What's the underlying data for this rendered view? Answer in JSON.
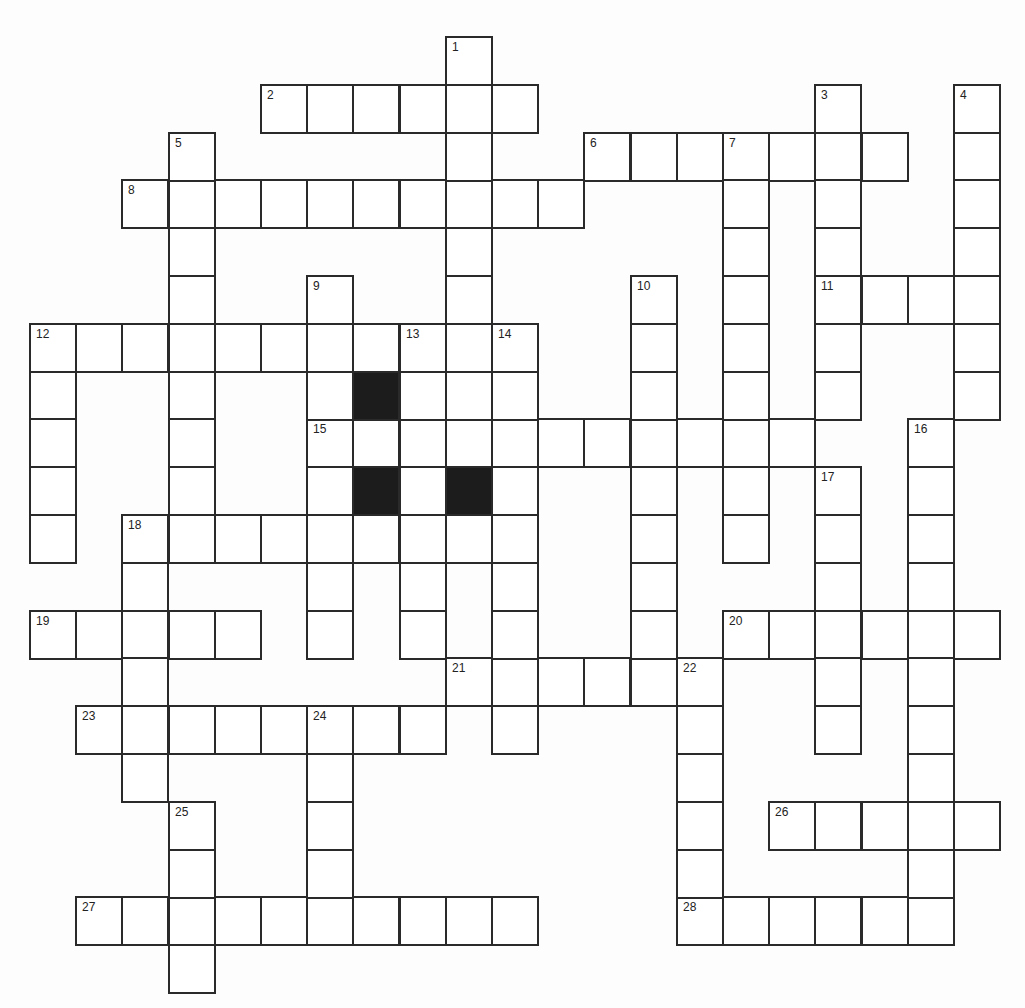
{
  "puzzle": {
    "type": "crossword",
    "grid": {
      "columns": 21,
      "rows": 20,
      "origin_x": 30,
      "origin_y": 37,
      "cell_width": 46.2,
      "cell_height": 47.8,
      "border_color": "#2a2a2a",
      "black_cell_color": "#1c1c1c"
    },
    "across": [
      {
        "number": 2,
        "row": 1,
        "col": 5,
        "length": 6
      },
      {
        "number": 6,
        "row": 2,
        "col": 12,
        "length": 7
      },
      {
        "number": 8,
        "row": 3,
        "col": 2,
        "length": 10
      },
      {
        "number": 11,
        "row": 5,
        "col": 17,
        "length": 4
      },
      {
        "number": 12,
        "row": 6,
        "col": 0,
        "length": 11
      },
      {
        "number": 15,
        "row": 8,
        "col": 6,
        "length": 11
      },
      {
        "number": 18,
        "row": 10,
        "col": 2,
        "length": 9
      },
      {
        "number": 19,
        "row": 12,
        "col": 0,
        "length": 5
      },
      {
        "number": 20,
        "row": 12,
        "col": 15,
        "length": 6
      },
      {
        "number": 21,
        "row": 13,
        "col": 9,
        "length": 6
      },
      {
        "number": 23,
        "row": 14,
        "col": 1,
        "length": 8
      },
      {
        "number": 26,
        "row": 16,
        "col": 16,
        "length": 5
      },
      {
        "number": 27,
        "row": 18,
        "col": 1,
        "length": 10
      },
      {
        "number": 28,
        "row": 18,
        "col": 14,
        "length": 6
      }
    ],
    "down": [
      {
        "number": 1,
        "row": 0,
        "col": 9,
        "length": 9
      },
      {
        "number": 3,
        "row": 1,
        "col": 17,
        "length": 7
      },
      {
        "number": 4,
        "row": 1,
        "col": 20,
        "length": 7
      },
      {
        "number": 5,
        "row": 2,
        "col": 3,
        "length": 9
      },
      {
        "number": 7,
        "row": 2,
        "col": 15,
        "length": 9
      },
      {
        "number": 9,
        "row": 5,
        "col": 6,
        "length": 8
      },
      {
        "number": 10,
        "row": 5,
        "col": 13,
        "length": 9
      },
      {
        "number": 12,
        "row": 6,
        "col": 0,
        "length": 5
      },
      {
        "number": 13,
        "row": 6,
        "col": 8,
        "length": 7
      },
      {
        "number": 14,
        "row": 6,
        "col": 10,
        "length": 9
      },
      {
        "number": 16,
        "row": 8,
        "col": 19,
        "length": 11
      },
      {
        "number": 17,
        "row": 9,
        "col": 17,
        "length": 6
      },
      {
        "number": 18,
        "row": 10,
        "col": 2,
        "length": 6
      },
      {
        "number": 22,
        "row": 13,
        "col": 14,
        "length": 6
      },
      {
        "number": 24,
        "row": 14,
        "col": 6,
        "length": 5
      },
      {
        "number": 25,
        "row": 16,
        "col": 3,
        "length": 4
      }
    ],
    "black_cells": [
      {
        "row": 7,
        "col": 7
      },
      {
        "row": 9,
        "col": 7
      },
      {
        "row": 9,
        "col": 9
      }
    ],
    "numbers": [
      {
        "n": "1",
        "row": 0,
        "col": 9
      },
      {
        "n": "2",
        "row": 1,
        "col": 5
      },
      {
        "n": "3",
        "row": 1,
        "col": 17
      },
      {
        "n": "4",
        "row": 1,
        "col": 20
      },
      {
        "n": "5",
        "row": 2,
        "col": 3
      },
      {
        "n": "6",
        "row": 2,
        "col": 12
      },
      {
        "n": "7",
        "row": 2,
        "col": 15
      },
      {
        "n": "8",
        "row": 3,
        "col": 2
      },
      {
        "n": "9",
        "row": 5,
        "col": 6
      },
      {
        "n": "10",
        "row": 5,
        "col": 13
      },
      {
        "n": "11",
        "row": 5,
        "col": 17
      },
      {
        "n": "12",
        "row": 6,
        "col": 0
      },
      {
        "n": "13",
        "row": 6,
        "col": 8
      },
      {
        "n": "14",
        "row": 6,
        "col": 10
      },
      {
        "n": "15",
        "row": 8,
        "col": 6
      },
      {
        "n": "16",
        "row": 8,
        "col": 19
      },
      {
        "n": "17",
        "row": 9,
        "col": 17
      },
      {
        "n": "18",
        "row": 10,
        "col": 2
      },
      {
        "n": "19",
        "row": 12,
        "col": 0
      },
      {
        "n": "20",
        "row": 12,
        "col": 15
      },
      {
        "n": "21",
        "row": 13,
        "col": 9
      },
      {
        "n": "22",
        "row": 13,
        "col": 14
      },
      {
        "n": "23",
        "row": 14,
        "col": 1
      },
      {
        "n": "24",
        "row": 14,
        "col": 6
      },
      {
        "n": "25",
        "row": 16,
        "col": 3
      },
      {
        "n": "26",
        "row": 16,
        "col": 16
      },
      {
        "n": "27",
        "row": 18,
        "col": 1
      },
      {
        "n": "28",
        "row": 18,
        "col": 14
      }
    ]
  }
}
